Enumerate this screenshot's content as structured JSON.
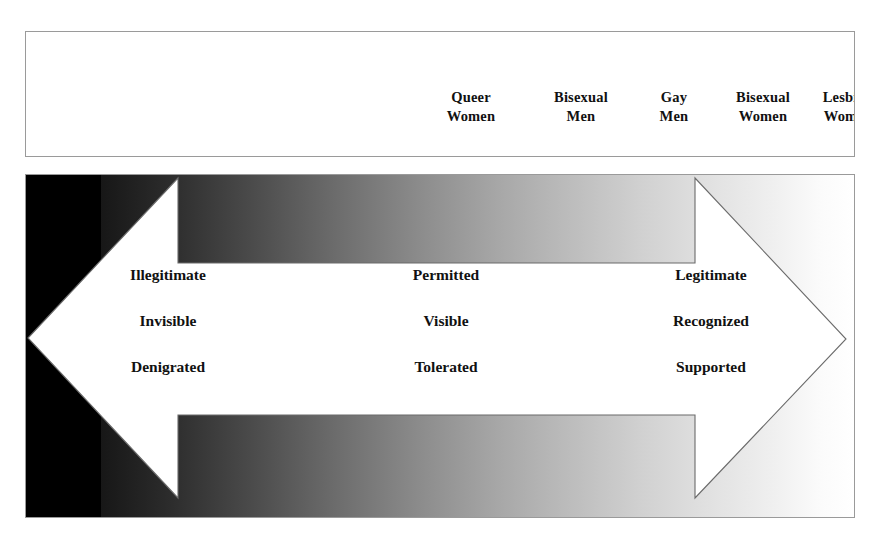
{
  "figure": {
    "spectrum": {
      "name": "identity-privilege-spectrum",
      "gradient_from": "#000000",
      "gradient_to": "#ffffff",
      "labels": [
        {
          "text": "Non-binary/\nGenderqueer\nPeople",
          "x": 88,
          "tone": "light"
        },
        {
          "text": "Trans\nMen",
          "x": 182,
          "tone": "light"
        },
        {
          "text": "Queer\nMen",
          "x": 265,
          "tone": "light"
        },
        {
          "text": "Trans\nWomen",
          "x": 355,
          "tone": "light"
        },
        {
          "text": "Queer\nWomen",
          "x": 470,
          "tone": "dark"
        },
        {
          "text": "Bisexual\nMen",
          "x": 580,
          "tone": "dark"
        },
        {
          "text": "Gay\nMen",
          "x": 673,
          "tone": "dark"
        },
        {
          "text": "Bisexual\nWomen",
          "x": 762,
          "tone": "dark"
        },
        {
          "text": "Lesbian\nWomen",
          "x": 847,
          "tone": "dark"
        }
      ]
    },
    "zone": {
      "caption": "Zone of Transition",
      "columns": [
        {
          "x": 167,
          "terms": [
            "Illegitimate",
            "Invisible",
            "Denigrated"
          ]
        },
        {
          "x": 445,
          "terms": [
            "Permitted",
            "Visible",
            "Tolerated"
          ]
        },
        {
          "x": 710,
          "terms": [
            "Legitimate",
            "Recognized",
            "Supported"
          ]
        }
      ]
    }
  }
}
